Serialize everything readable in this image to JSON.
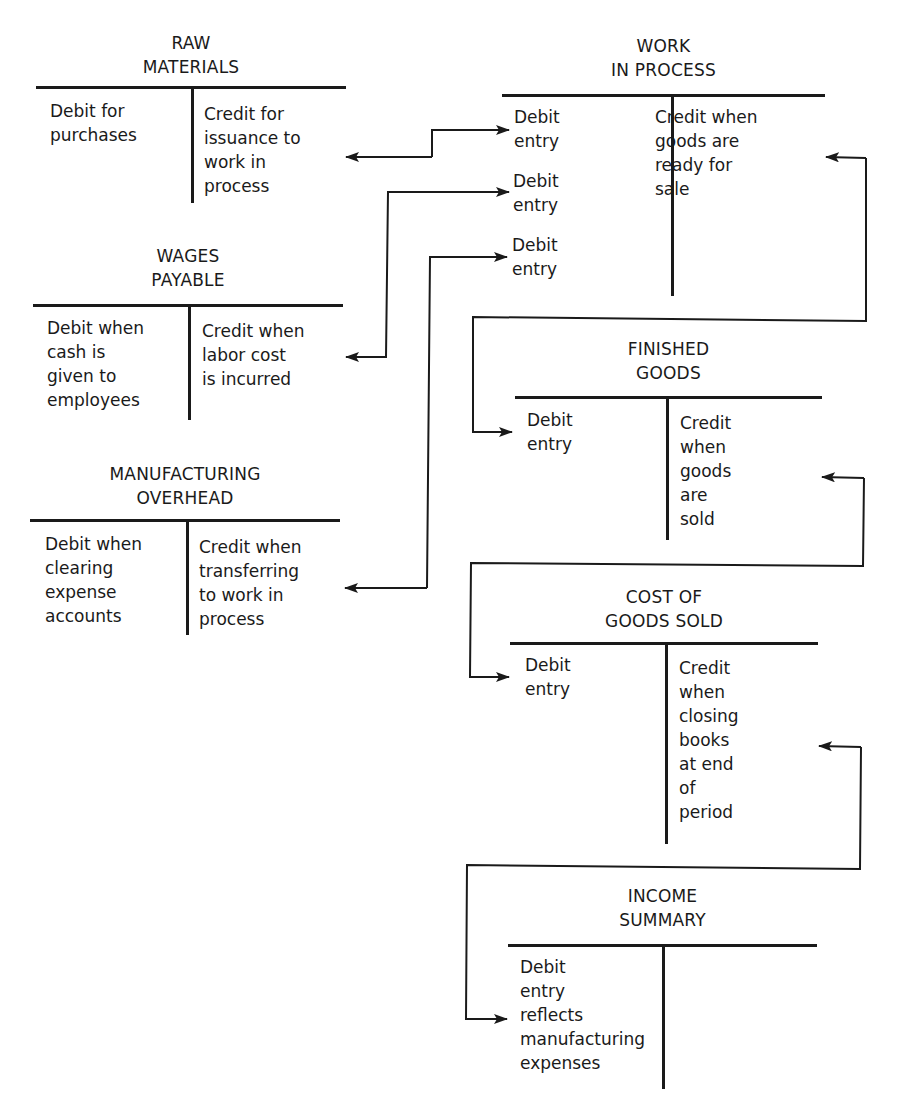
{
  "accounts": {
    "raw_materials": {
      "title": "RAW\nMATERIALS",
      "debit": "Debit for\npurchases",
      "credit": "Credit for\nissuance to\nwork in\nprocess"
    },
    "work_in_process": {
      "title": "WORK\nIN PROCESS",
      "debits": [
        "Debit\nentry",
        "Debit\nentry",
        "Debit\nentry"
      ],
      "credit": "Credit when\ngoods are\nready for\nsale"
    },
    "wages_payable": {
      "title": "WAGES\nPAYABLE",
      "debit": "Debit when\ncash is\ngiven to\nemployees",
      "credit": "Credit when\nlabor cost\nis incurred"
    },
    "manufacturing_overhead": {
      "title": "MANUFACTURING\nOVERHEAD",
      "debit": "Debit when\nclearing\nexpense\naccounts",
      "credit": "Credit when\ntransferring\nto work in\nprocess"
    },
    "finished_goods": {
      "title": "FINISHED\nGOODS",
      "debit": "Debit\nentry",
      "credit": "Credit\nwhen\ngoods\nare\nsold"
    },
    "cost_of_goods_sold": {
      "title": "COST OF\nGOODS SOLD",
      "debit": "Debit\nentry",
      "credit": "Credit\nwhen\nclosing\nbooks\nat end\nof\nperiod"
    },
    "income_summary": {
      "title": "INCOME\nSUMMARY",
      "debit": "Debit\nentry\nreflects\nmanufacturing\nexpenses",
      "credit": ""
    }
  },
  "connections": [
    {
      "from": "raw_materials.credit",
      "to": "work_in_process.debit_1"
    },
    {
      "from": "wages_payable.credit",
      "to": "work_in_process.debit_2"
    },
    {
      "from": "manufacturing_overhead.credit",
      "to": "work_in_process.debit_3"
    },
    {
      "from": "work_in_process.credit",
      "to": "finished_goods.debit"
    },
    {
      "from": "finished_goods.credit",
      "to": "cost_of_goods_sold.debit"
    },
    {
      "from": "cost_of_goods_sold.credit",
      "to": "income_summary.debit"
    }
  ],
  "colors": {
    "ink": "#1a1a1a",
    "background": "#ffffff"
  }
}
